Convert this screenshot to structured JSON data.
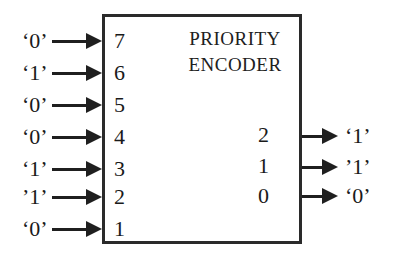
{
  "diagram": {
    "type": "block-diagram",
    "title_lines": [
      "PRIORITY",
      "ENCODER"
    ],
    "box_border_color": "#2a2a2a",
    "background_color": "#ffffff",
    "text_color": "#1a1a1a",
    "inputs": [
      {
        "pin": "7",
        "value": "‘0’"
      },
      {
        "pin": "6",
        "value": "‘1’"
      },
      {
        "pin": "5",
        "value": "‘0’"
      },
      {
        "pin": "4",
        "value": "‘0’"
      },
      {
        "pin": "3",
        "value": "‘1’"
      },
      {
        "pin": "2",
        "value": "’1’"
      },
      {
        "pin": "1",
        "value": "‘0’"
      }
    ],
    "outputs": [
      {
        "pin": "2",
        "value": "‘1’"
      },
      {
        "pin": "1",
        "value": "’1’"
      },
      {
        "pin": "0",
        "value": "‘0’"
      }
    ]
  }
}
